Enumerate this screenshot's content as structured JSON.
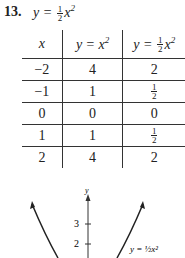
{
  "problem": {
    "number": "13.",
    "equation_lhs": "y =",
    "equation_frac_num": "1",
    "equation_frac_den": "2",
    "equation_rhs": "x",
    "equation_exp": "2"
  },
  "table": {
    "headers": [
      {
        "text": "x"
      },
      {
        "text": "y = x",
        "exp": "2"
      },
      {
        "text": "y =",
        "frac": [
          "1",
          "2"
        ],
        "rhs": "x",
        "exp": "2"
      }
    ],
    "rows": [
      {
        "x": "−2",
        "y1": "4",
        "y2": "2"
      },
      {
        "x": "−1",
        "y1": "1",
        "y2_frac": [
          "1",
          "2"
        ]
      },
      {
        "x": "0",
        "y1": "0",
        "y2": "0"
      },
      {
        "x": "1",
        "y1": "1",
        "y2_frac": [
          "1",
          "2"
        ]
      },
      {
        "x": "2",
        "y1": "4",
        "y2": "2"
      }
    ]
  },
  "graph": {
    "axis_label": "y",
    "ticks": [
      "3",
      "2"
    ],
    "curve_label": "y = ½x²"
  }
}
